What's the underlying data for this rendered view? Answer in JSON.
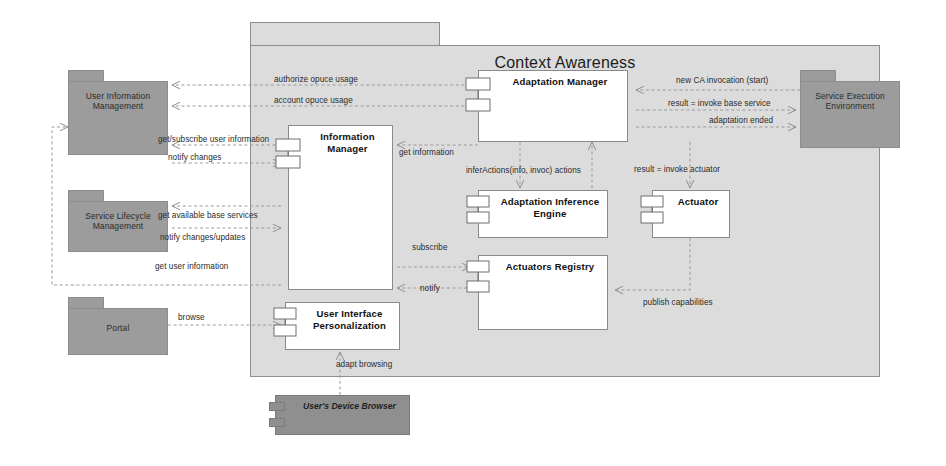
{
  "diagram": {
    "title": "Context Awareness",
    "kind": "UML component diagram"
  },
  "container": {
    "name": "Context Awareness"
  },
  "external_packages": [
    {
      "id": "uim",
      "name": "User Information\nManagement"
    },
    {
      "id": "slm",
      "name": "Service Lifecycle\nManagement"
    },
    {
      "id": "portal",
      "name": "Portal"
    },
    {
      "id": "see",
      "name": "Service Execution\nEnvironment"
    }
  ],
  "components": [
    {
      "id": "information-manager",
      "name": "Information Manager"
    },
    {
      "id": "adaptation-manager",
      "name": "Adaptation Manager"
    },
    {
      "id": "adaptation-inference-engine",
      "name": "Adaptation Inference\nEngine"
    },
    {
      "id": "actuator",
      "name": "Actuator"
    },
    {
      "id": "actuators-registry",
      "name": "Actuators Registry"
    },
    {
      "id": "user-interface-personalization",
      "name": "User Interface\nPersonalization"
    }
  ],
  "devices": [
    {
      "id": "users-device-browser",
      "name": "User's Device Browser"
    }
  ],
  "edge_labels": {
    "authorize_opuce_usage": "authorize opuce usage",
    "account_opuce_usage": "account opuce usage",
    "get_subscribe_user_information": "get/subscribe user information",
    "notify_changes": "notify changes",
    "get_available_base_services": "get available base services",
    "notify_changes_updates": "notify changes/updates",
    "get_user_information": "get user information",
    "browse": "browse",
    "get_information": "get information",
    "infer_actions": "inferActions(info, invoc)   actions",
    "result_invoke_actuator": "result = invoke actuator",
    "subscribe": "subscribe",
    "notify": "notify",
    "publish_capabilities": "publish capabilities",
    "adapt_browsing": "adapt browsing",
    "new_ca_invocation": "new CA invocation (start)",
    "result_invoke_base_service": "result = invoke base service",
    "adaptation_ended": "adaptation ended"
  },
  "colors": {
    "background": "#ffffff",
    "container_fill": "#dcdcdc",
    "external_fill": "#9c9c9c",
    "component_fill": "#ffffff",
    "device_fill": "#8f8f8f",
    "stroke": "#8a8a8a",
    "edge": "#9a9a9a",
    "text": "#2a2a2a"
  }
}
